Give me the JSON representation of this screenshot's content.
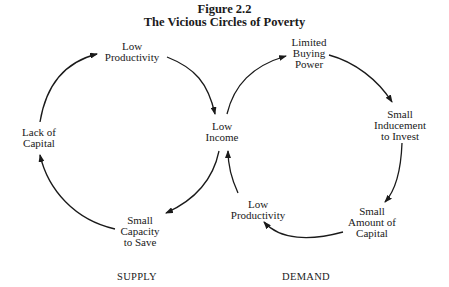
{
  "figure": {
    "number": "Figure 2.2",
    "title": "The Vicious Circles of Poverty"
  },
  "supply_circle": {
    "label": "SUPPLY",
    "nodes": [
      {
        "id": "low-productivity",
        "lines": [
          "Low",
          "Productivity"
        ]
      },
      {
        "id": "low-income",
        "lines": [
          "Low",
          "Income"
        ]
      },
      {
        "id": "small-capacity-to-save",
        "lines": [
          "Small",
          "Capacity",
          "to Save"
        ]
      },
      {
        "id": "lack-of-capital",
        "lines": [
          "Lack of",
          "Capital"
        ]
      }
    ]
  },
  "demand_circle": {
    "label": "DEMAND",
    "nodes": [
      {
        "id": "limited-buying-power",
        "lines": [
          "Limited",
          "Buying",
          "Power"
        ]
      },
      {
        "id": "small-inducement-to-invest",
        "lines": [
          "Small",
          "Inducement",
          "to Invest"
        ]
      },
      {
        "id": "small-amount-of-capital",
        "lines": [
          "Small",
          "Amount of",
          "Capital"
        ]
      },
      {
        "id": "low-productivity-demand",
        "lines": [
          "Low",
          "Productivity"
        ]
      }
    ]
  },
  "colors": {
    "ink": "#1a1a1a",
    "background": "#ffffff"
  }
}
